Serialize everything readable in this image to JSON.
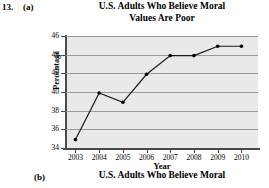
{
  "exercise": {
    "number": "13.",
    "part_a": "(a)",
    "part_b": "(b)"
  },
  "titles": {
    "chart_title_line1": "U.S. Adults Who Believe Moral",
    "chart_title_line2": "Values Are Poor",
    "next_chart_title": "U.S. Adults Who Believe Moral"
  },
  "chart_data": {
    "type": "line",
    "title": "U.S. Adults Who Believe Moral Values Are Poor",
    "xlabel": "Year",
    "ylabel": "Percentage",
    "x": [
      2003,
      2004,
      2005,
      2006,
      2007,
      2008,
      2009,
      2010
    ],
    "xtick_labels": [
      "2003",
      "2004",
      "2005",
      "2006",
      "2007",
      "2008",
      "2009",
      "2010"
    ],
    "values": [
      34.9,
      39.9,
      38.9,
      41.9,
      43.9,
      43.9,
      44.9,
      44.9
    ],
    "ytick_labels": [
      "46",
      "44",
      "42",
      "40",
      "38",
      "36",
      "34"
    ],
    "yticks": [
      46,
      44,
      42,
      40,
      38,
      36,
      34
    ],
    "ylim": [
      34,
      46
    ],
    "xlim": [
      2002.6,
      2010.7
    ],
    "grid": true,
    "grid_orientation": "horizontal",
    "legend": "none",
    "marker": "filled-circle",
    "line_color": "#1a1a1a",
    "marker_color": "#000000",
    "plot_background": "#e9e9e9",
    "gridline_color": "#9a9a9a",
    "axis_color": "#4a4a4a"
  }
}
